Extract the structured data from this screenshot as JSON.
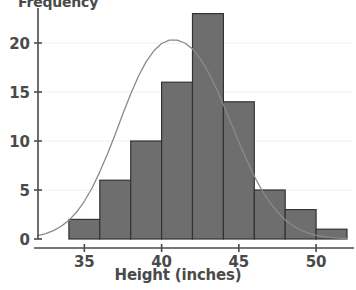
{
  "chart_data": {
    "type": "bar",
    "title": "",
    "xlabel": "Height (inches)",
    "ylabel": "Frequency",
    "categories": [
      "34-36",
      "36-38",
      "38-40",
      "40-42",
      "42-44",
      "44-46",
      "46-48",
      "48-50",
      "50-52"
    ],
    "bin_edges": [
      34,
      36,
      38,
      40,
      42,
      44,
      46,
      48,
      50,
      52
    ],
    "values": [
      2,
      6,
      10,
      16,
      23,
      14,
      5,
      3,
      1
    ],
    "bin_width": 2,
    "xlim": [
      32,
      52
    ],
    "ylim": [
      0,
      23.8
    ],
    "xticks": [
      35,
      40,
      45,
      50
    ],
    "yticks": [
      0,
      5,
      10,
      15,
      20
    ],
    "xtick_labels": [
      "35",
      "40",
      "45",
      "50"
    ],
    "ytick_labels": [
      "0",
      "5",
      "10",
      "15",
      "20"
    ],
    "grid": true,
    "legend": "none",
    "bar_color": "#6e6e6e",
    "bar_edge_color": "#333333",
    "curve_color": "#8a8a8a",
    "axis_color": "#4a4a4a",
    "grid_color": "#f0f0f0",
    "background_color": "#ffffff",
    "overlay": {
      "type": "line",
      "name": "normal curve",
      "mean": 42.3,
      "stddev": 3.2,
      "peak_value": 20.3,
      "points": [
        [
          32.0,
          0.35
        ],
        [
          32.5,
          0.55
        ],
        [
          33.0,
          0.85
        ],
        [
          33.5,
          1.3
        ],
        [
          34.0,
          1.9
        ],
        [
          34.5,
          2.75
        ],
        [
          35.0,
          3.85
        ],
        [
          35.5,
          5.2
        ],
        [
          36.0,
          6.85
        ],
        [
          36.5,
          8.7
        ],
        [
          37.0,
          10.7
        ],
        [
          37.5,
          12.8
        ],
        [
          38.0,
          14.8
        ],
        [
          38.5,
          16.6
        ],
        [
          39.0,
          18.1
        ],
        [
          39.5,
          19.2
        ],
        [
          40.0,
          19.95
        ],
        [
          40.5,
          20.3
        ],
        [
          41.0,
          20.3
        ],
        [
          41.5,
          20.0
        ],
        [
          42.0,
          19.4
        ],
        [
          42.5,
          18.4
        ],
        [
          43.0,
          17.1
        ],
        [
          43.5,
          15.5
        ],
        [
          44.0,
          13.7
        ],
        [
          44.5,
          11.8
        ],
        [
          45.0,
          9.9
        ],
        [
          45.5,
          8.1
        ],
        [
          46.0,
          6.4
        ],
        [
          46.5,
          4.95
        ],
        [
          47.0,
          3.75
        ],
        [
          47.5,
          2.75
        ],
        [
          48.0,
          1.95
        ],
        [
          48.5,
          1.35
        ],
        [
          49.0,
          0.9
        ],
        [
          49.5,
          0.6
        ],
        [
          50.0,
          0.38
        ],
        [
          50.5,
          0.24
        ],
        [
          51.0,
          0.14
        ],
        [
          51.5,
          0.08
        ],
        [
          52.0,
          0.05
        ]
      ]
    }
  }
}
